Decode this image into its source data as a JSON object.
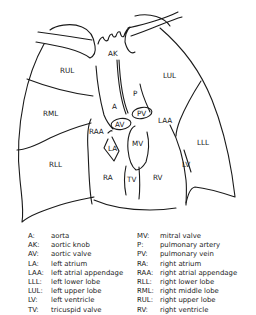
{
  "diagram": {
    "title": "",
    "regions": [
      {
        "id": "RUL",
        "label": "RUL",
        "x": 64,
        "y": 73
      },
      {
        "id": "RML",
        "label": "RML",
        "x": 48,
        "y": 116
      },
      {
        "id": "RLL",
        "label": "RLL",
        "x": 55,
        "y": 167
      },
      {
        "id": "LUL",
        "label": "LUL",
        "x": 170,
        "y": 78
      },
      {
        "id": "LLL",
        "label": "LLL",
        "x": 203,
        "y": 145
      },
      {
        "id": "AK",
        "label": "AK",
        "x": 113,
        "y": 55
      },
      {
        "id": "A",
        "label": "A",
        "x": 115,
        "y": 109
      },
      {
        "id": "P",
        "label": "P",
        "x": 135,
        "y": 95
      },
      {
        "id": "PV",
        "label": "PV",
        "x": 141,
        "y": 116
      },
      {
        "id": "AV",
        "label": "AV",
        "x": 119,
        "y": 125
      },
      {
        "id": "LAA",
        "label": "LAA",
        "x": 163,
        "y": 122
      },
      {
        "id": "RAA",
        "label": "RAA",
        "x": 98,
        "y": 133
      },
      {
        "id": "LA",
        "label": "LA",
        "x": 112,
        "y": 149
      },
      {
        "id": "MV",
        "label": "MV",
        "x": 139,
        "y": 145
      },
      {
        "id": "RA",
        "label": "RA",
        "x": 107,
        "y": 178
      },
      {
        "id": "TV",
        "label": "TV",
        "x": 131,
        "y": 181
      },
      {
        "id": "RV",
        "label": "RV",
        "x": 157,
        "y": 179
      },
      {
        "id": "LV",
        "label": "LV",
        "x": 186,
        "y": 166
      }
    ]
  },
  "legend": {
    "left": [
      {
        "abbr": "A:",
        "meaning": "aorta"
      },
      {
        "abbr": "AK:",
        "meaning": "aortic knob"
      },
      {
        "abbr": "AV:",
        "meaning": "aortic valve"
      },
      {
        "abbr": "LA:",
        "meaning": "left atrium"
      },
      {
        "abbr": "LAA:",
        "meaning": "left atrial appendage"
      },
      {
        "abbr": "LLL:",
        "meaning": "left lower lobe"
      },
      {
        "abbr": "LUL:",
        "meaning": "left upper lobe"
      },
      {
        "abbr": "LV:",
        "meaning": "left ventricle"
      },
      {
        "abbr": "TV:",
        "meaning": "tricuspid valve"
      }
    ],
    "right": [
      {
        "abbr": "MV:",
        "meaning": "mitral valve"
      },
      {
        "abbr": "P:",
        "meaning": "pulmonary artery"
      },
      {
        "abbr": "PV:",
        "meaning": "pulmonary vein"
      },
      {
        "abbr": "RA:",
        "meaning": "right atrium"
      },
      {
        "abbr": "RAA:",
        "meaning": "right atrial appendage"
      },
      {
        "abbr": "RLL:",
        "meaning": "right lower lobe"
      },
      {
        "abbr": "RML:",
        "meaning": "right middle lobe"
      },
      {
        "abbr": "RUL:",
        "meaning": "right upper lobe"
      },
      {
        "abbr": "RV:",
        "meaning": "right ventricle"
      }
    ]
  }
}
